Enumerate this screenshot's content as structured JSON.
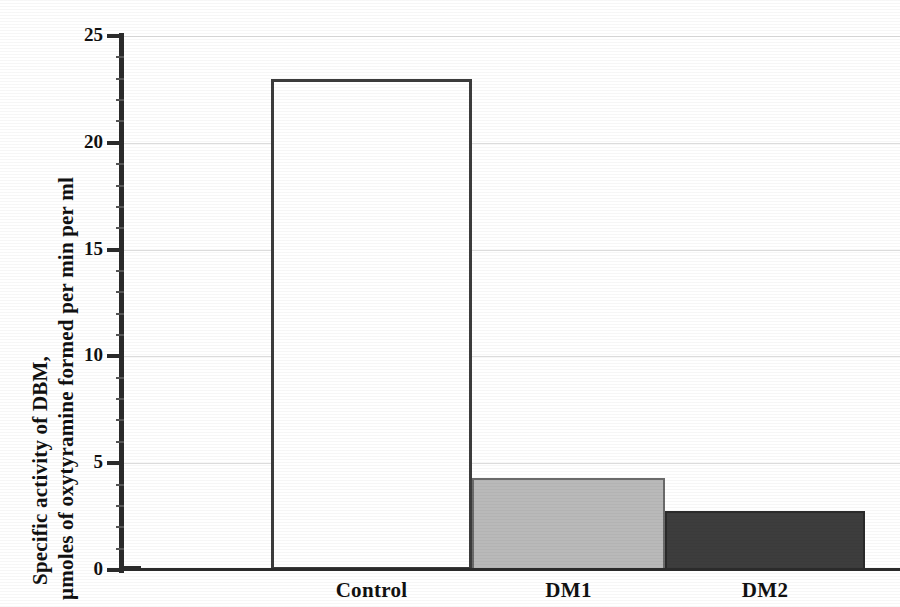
{
  "chart_data": {
    "type": "bar",
    "title": "",
    "subtitle": "",
    "xlabel": "",
    "ylabel_line1": "Specific activity of DBM,",
    "ylabel_line2": "µmoles of oxytyramine formed per min per ml",
    "categories": [
      "Control",
      "DM1",
      "DM2"
    ],
    "values": [
      23,
      4.3,
      2.75
    ],
    "series": [
      {
        "name": "Specific activity of DBM",
        "values": [
          23,
          4.3,
          2.75
        ]
      }
    ],
    "bar_styles": [
      {
        "category": "Control",
        "fill": "#ffffff",
        "border": "#3c3c3c",
        "label": "white-open-bar"
      },
      {
        "category": "DM1",
        "fill": "#b9b9b9",
        "border": "#6a6a6a",
        "label": "light-gray-bar"
      },
      {
        "category": "DM2",
        "fill": "#3d3d3d",
        "border": "#2a2a2a",
        "label": "dark-gray-bar"
      }
    ],
    "ylim": [
      0,
      25
    ],
    "yticks": [
      0,
      5,
      10,
      15,
      20,
      25
    ],
    "ytick_labels": [
      "0",
      "5",
      "10",
      "15",
      "20",
      "25"
    ],
    "grid": true,
    "grid_axis": "y",
    "grid_color": "#dcdcdc",
    "legend": false,
    "legend_position": "none",
    "axis_color": "#2b2b2b",
    "background": "#ffffff"
  },
  "axis": {
    "y": {
      "ticks": [
        {
          "value": 25,
          "label": "25"
        },
        {
          "value": 20,
          "label": "20"
        },
        {
          "value": 15,
          "label": "15"
        },
        {
          "value": 10,
          "label": "10"
        },
        {
          "value": 5,
          "label": "5"
        },
        {
          "value": 0,
          "label": "0"
        }
      ]
    },
    "x": {
      "ticks": [
        {
          "label": "Control"
        },
        {
          "label": "DM1"
        },
        {
          "label": "DM2"
        }
      ]
    }
  }
}
